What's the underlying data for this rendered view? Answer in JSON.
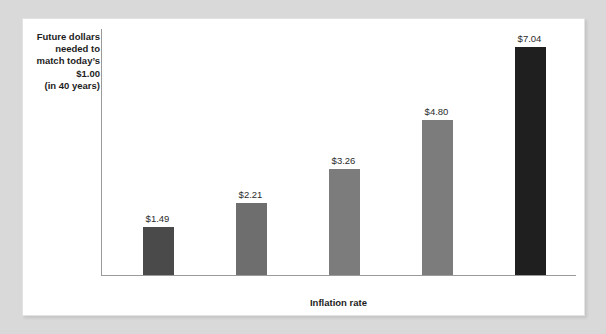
{
  "chart_data": {
    "type": "bar",
    "title": "",
    "xlabel": "Inflation rate",
    "ylabel": "Future dollars needed to match today's $1.00 (in 40 years)",
    "ylabel_lines": [
      "Future dollars",
      "needed to",
      "match today’s",
      "$1.00",
      "(in 40 years)"
    ],
    "categories": [
      "1%",
      "2%",
      "3%",
      "4%",
      "5%"
    ],
    "values": [
      1.49,
      2.21,
      3.26,
      4.8,
      7.04
    ],
    "value_labels": [
      "$1.49",
      "$2.21",
      "$3.26",
      "$4.80",
      "$7.04"
    ],
    "bar_colors": [
      "#4a4a4a",
      "#6e6e6e",
      "#7c7c7c",
      "#7c7c7c",
      "#1f1f1f"
    ],
    "ylim": [
      0,
      7.6
    ],
    "grid": false,
    "legend": false,
    "axis_color": "#9a9a9a",
    "panel_color": "#ffffff",
    "page_color": "#d9d9d9"
  }
}
